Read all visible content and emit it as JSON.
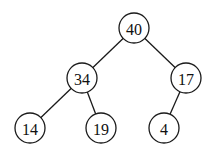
{
  "diagram": {
    "type": "binary-tree",
    "nodes": [
      {
        "id": "n40",
        "label": "40",
        "x": 134,
        "y": 28
      },
      {
        "id": "n34",
        "label": "34",
        "x": 82,
        "y": 78
      },
      {
        "id": "n17",
        "label": "17",
        "x": 186,
        "y": 78
      },
      {
        "id": "n14",
        "label": "14",
        "x": 30,
        "y": 128
      },
      {
        "id": "n19",
        "label": "19",
        "x": 101,
        "y": 128
      },
      {
        "id": "n4",
        "label": "4",
        "x": 164,
        "y": 128
      }
    ],
    "edges": [
      {
        "from": "40",
        "to": "34"
      },
      {
        "from": "40",
        "to": "17"
      },
      {
        "from": "34",
        "to": "14"
      },
      {
        "from": "34",
        "to": "19"
      },
      {
        "from": "17",
        "to": "4"
      }
    ],
    "node_radius": 15,
    "stroke_color": "#1a1a1a"
  }
}
